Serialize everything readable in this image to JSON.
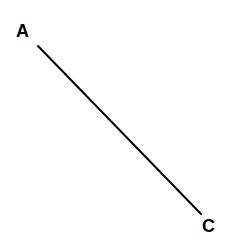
{
  "figure": {
    "type": "line-segment-diagram",
    "background_color": "#ffffff",
    "canvas": {
      "width": 230,
      "height": 250
    },
    "stroke_color": "#000000",
    "stroke_width": 2,
    "segment": {
      "name": "AC",
      "from_label": "A",
      "to_label": "C",
      "x1": 38,
      "y1": 46,
      "x2": 201,
      "y2": 214
    },
    "labels": [
      {
        "id": "A",
        "text": "A",
        "x": 16,
        "y": 22,
        "color": "#000000",
        "font_size": 18,
        "bold": true
      },
      {
        "id": "C",
        "text": "C",
        "x": 202,
        "y": 217,
        "color": "#000000",
        "font_size": 18,
        "bold": true
      }
    ]
  }
}
